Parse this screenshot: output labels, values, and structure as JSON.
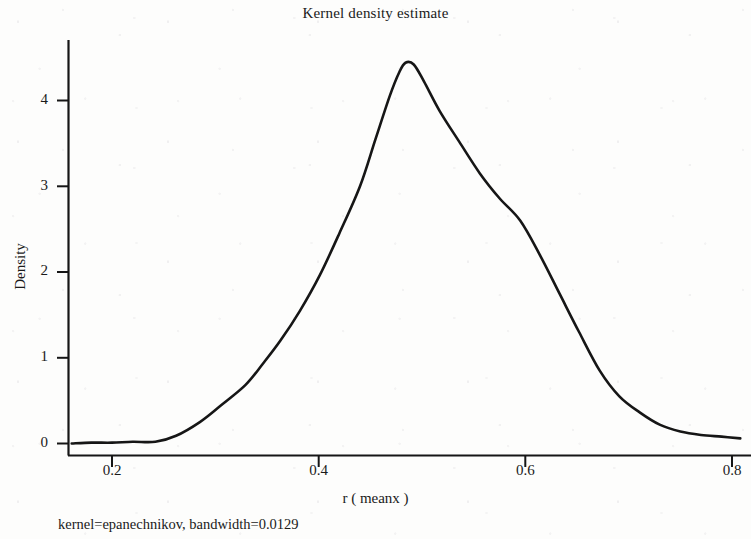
{
  "chart_data": {
    "type": "line",
    "title": "Kernel density estimate",
    "xlabel": "r ( meanx )",
    "ylabel": "Density",
    "footnote": "kernel=epanechnikov,  bandwidth=0.0129",
    "grid": false,
    "legend": null,
    "line_color": "#161616",
    "xlim": [
      0.158,
      0.812
    ],
    "ylim": [
      -0.05,
      4.62
    ],
    "xticks": [
      0.2,
      0.4,
      0.6,
      0.8
    ],
    "xtick_labels": [
      "0.2",
      "0.4",
      "0.6",
      "0.8"
    ],
    "yticks": [
      0,
      1,
      2,
      3,
      4
    ],
    "ytick_labels": [
      "0",
      "1",
      "2",
      "3",
      "4"
    ],
    "series": [
      {
        "name": "Density",
        "x": [
          0.161,
          0.18,
          0.2,
          0.22,
          0.242,
          0.262,
          0.285,
          0.305,
          0.329,
          0.346,
          0.363,
          0.382,
          0.401,
          0.42,
          0.44,
          0.455,
          0.469,
          0.478,
          0.484,
          0.492,
          0.502,
          0.517,
          0.536,
          0.556,
          0.575,
          0.595,
          0.614,
          0.633,
          0.652,
          0.672,
          0.691,
          0.711,
          0.73,
          0.75,
          0.77,
          0.79,
          0.808
        ],
        "y": [
          0.0,
          0.01,
          0.01,
          0.02,
          0.02,
          0.09,
          0.25,
          0.44,
          0.68,
          0.93,
          1.2,
          1.55,
          1.96,
          2.45,
          3.0,
          3.55,
          4.06,
          4.33,
          4.44,
          4.42,
          4.22,
          3.88,
          3.52,
          3.15,
          2.86,
          2.6,
          2.2,
          1.75,
          1.3,
          0.85,
          0.55,
          0.36,
          0.22,
          0.14,
          0.1,
          0.08,
          0.06
        ]
      }
    ],
    "peak": {
      "x": 0.484,
      "y": 4.44
    }
  },
  "figure": {
    "title": "Kernel density estimate",
    "x_axis_title": "r ( meanx )",
    "y_axis_title": "Density",
    "footnote": "kernel=epanechnikov,  bandwidth=0.0129",
    "x_tick_labels": [
      "0.2",
      "0.4",
      "0.6",
      "0.8"
    ],
    "y_tick_labels": [
      "0",
      "1",
      "2",
      "3",
      "4"
    ]
  }
}
